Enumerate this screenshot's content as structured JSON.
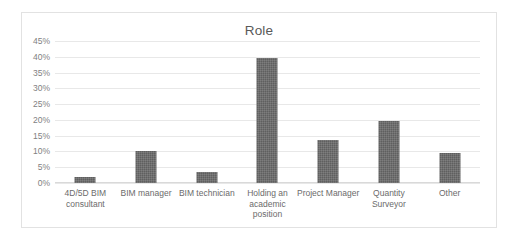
{
  "chart_data": {
    "type": "bar",
    "title": "Role",
    "xlabel": "",
    "ylabel": "",
    "categories": [
      "4D/5D BIM consultant",
      "BIM manager",
      "BIM technician",
      "Holding an academic position",
      "Project Manager",
      "Quantity Surveyor",
      "Other"
    ],
    "values": [
      2,
      10,
      3.5,
      39.5,
      13.5,
      19.5,
      9.5
    ],
    "value_labels": [
      "2%",
      "10%",
      "3.5%",
      "39.5%",
      "13.5%",
      "19.5%",
      "9.5%"
    ],
    "ylim": [
      0,
      45
    ],
    "ytick_labels": [
      "45%",
      "40%",
      "35%",
      "30%",
      "25%",
      "20%",
      "15%",
      "10%",
      "5%",
      "0%"
    ],
    "ytick_values": [
      45,
      40,
      35,
      30,
      25,
      20,
      15,
      10,
      5,
      0
    ],
    "grid": true,
    "legend": false,
    "legend_position": "none",
    "bar_color": "#5f5f5f",
    "gridline_color": "#e8e8e8",
    "border_color": "#e2e2e2",
    "title_color": "#595959",
    "tick_label_color": "#7f7f7f"
  }
}
